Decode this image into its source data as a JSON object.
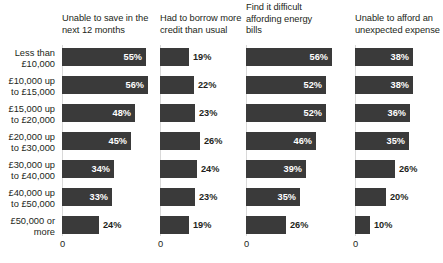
{
  "chart_data": {
    "type": "bar",
    "orientation": "horizontal",
    "layout": "small-multiples",
    "title": "",
    "xlabel": "",
    "ylabel": "",
    "grid": false,
    "legend": "none",
    "xlim": [
      0,
      60
    ],
    "axis_tick_labels": [
      "0"
    ],
    "value_suffix": "%",
    "categories": [
      "Less than\n£10,000",
      "£10,000 up\nto £15,000",
      "£15,000 up\nto £20,000",
      "£20,000 up\nto £30,000",
      "£30,000 up\nto £40,000",
      "£40,000 up\nto £50,000",
      "£50,000 or\nmore"
    ],
    "series": [
      {
        "name": "Unable to save in the next 12 months",
        "values": [
          55,
          56,
          48,
          45,
          34,
          33,
          24
        ],
        "labels": [
          "55%",
          "56%",
          "48%",
          "45%",
          "34%",
          "33%",
          "24%"
        ]
      },
      {
        "name": "Had to borrow more credit than usual",
        "values": [
          19,
          22,
          23,
          26,
          24,
          23,
          19
        ],
        "labels": [
          "19%",
          "22%",
          "23%",
          "26%",
          "24%",
          "23%",
          "19%"
        ]
      },
      {
        "name": "Find it difficult affording energy bills",
        "values": [
          56,
          52,
          52,
          46,
          39,
          35,
          26
        ],
        "labels": [
          "56%",
          "52%",
          "52%",
          "46%",
          "39%",
          "35%",
          "26%"
        ]
      },
      {
        "name": "Unable to afford an unexpected expense",
        "values": [
          38,
          38,
          36,
          35,
          26,
          20,
          10
        ],
        "labels": [
          "38%",
          "38%",
          "36%",
          "35%",
          "26%",
          "20%",
          "10%"
        ]
      }
    ],
    "colors": {
      "bar": "#3a3a3a",
      "inside_label": "#ffffff",
      "outside_label": "#231f20",
      "axis": "#d9d9d9",
      "background": "#ffffff"
    }
  },
  "panels": [
    {
      "title": "Unable to save in the\nnext 12 months"
    },
    {
      "title": "Had to borrow more\ncredit than usual"
    },
    {
      "title": "Find it difficult\naffording energy\nbills"
    },
    {
      "title": "Unable to afford an\nunexpected expense"
    }
  ]
}
